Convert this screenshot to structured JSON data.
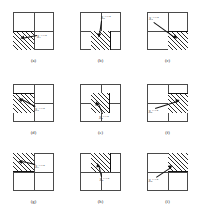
{
  "figure": {
    "type": "stencil-diagram-grid",
    "rows": 3,
    "cols": 3,
    "cell_grid": "2x2",
    "hatch_style": "diagonal-45",
    "colors": {
      "line": "#4a4a4a",
      "hatch": "#2b2b2b",
      "emphasis_edge": "#111111",
      "background": "#ffffff"
    }
  },
  "panels": [
    {
      "id": "a",
      "caption": "(a)",
      "stencil_region": "bottom-left quadrant",
      "label": {
        "base": "S",
        "sub": "1",
        "sup": "i+1/2"
      },
      "label_position": "right-of-center",
      "arrow_direction": "left-down"
    },
    {
      "id": "b",
      "caption": "(b)",
      "stencil_region": "bottom-center column",
      "label": {
        "base": "S",
        "sub": "2",
        "sup": "i+1/2"
      },
      "label_position": "above-center",
      "arrow_direction": "down"
    },
    {
      "id": "c",
      "caption": "(c)",
      "stencil_region": "bottom-right quadrant",
      "label": {
        "base": "S",
        "sub": "3",
        "sup": "i+1/2"
      },
      "label_position": "upper-left",
      "arrow_direction": "right-down"
    },
    {
      "id": "d",
      "caption": "(d)",
      "stencil_region": "middle-left row",
      "label": {
        "base": "S",
        "sub": "4",
        "sup": "i+1/2"
      },
      "label_position": "right-of-center",
      "arrow_direction": "left"
    },
    {
      "id": "e",
      "caption": "(e)",
      "stencil_region": "center cell",
      "label": {
        "base": "S",
        "sub": "5",
        "sup": "i+1/2"
      },
      "label_position": "below-center",
      "arrow_direction": "up-left"
    },
    {
      "id": "f",
      "caption": "(f)",
      "stencil_region": "middle-right row",
      "label": {
        "base": "S",
        "sub": "6",
        "sup": "i+1/2"
      },
      "label_position": "lower-left",
      "arrow_direction": "right-up"
    },
    {
      "id": "g",
      "caption": "(g)",
      "stencil_region": "top-left quadrant",
      "label": {
        "base": "S",
        "sub": "7",
        "sup": "i+1/2"
      },
      "label_position": "right-of-center",
      "arrow_direction": "left-up"
    },
    {
      "id": "h",
      "caption": "(h)",
      "stencil_region": "top-center column",
      "label": {
        "base": "S",
        "sub": "8",
        "sup": "i+1/2"
      },
      "label_position": "below-center",
      "arrow_direction": "up"
    },
    {
      "id": "i",
      "caption": "(i)",
      "stencil_region": "top-right quadrant",
      "label": {
        "base": "S",
        "sub": "9",
        "sup": "i+1/2"
      },
      "label_position": "lower-left",
      "arrow_direction": "right-up"
    }
  ]
}
